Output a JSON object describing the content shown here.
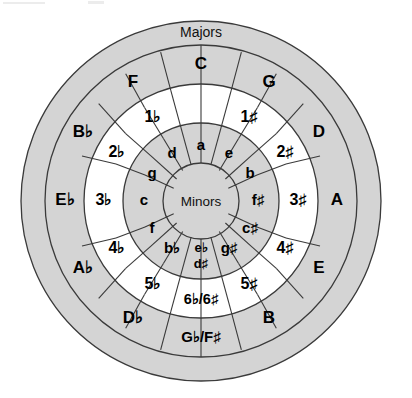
{
  "figure": {
    "outer_band_label": "Majors",
    "center_label": "Minors",
    "geometry": {
      "cx": 201,
      "cy": 201,
      "r_outer": 180,
      "r_band_inner": 156,
      "r_major_inner": 117,
      "r_numbers_inner": 78,
      "r_minor_inner": 38
    },
    "colors": {
      "gray_ring": "#d4d4d4",
      "white_ring": "#ffffff",
      "stroke": "#3a3a3a",
      "text": "#000000",
      "background": "#ffffff"
    }
  },
  "rings": {
    "majors": {
      "name": "majors-ring",
      "segments": [
        {
          "id": "major-c",
          "label": "C",
          "angle": 0
        },
        {
          "id": "major-g",
          "label": "G",
          "angle": 30
        },
        {
          "id": "major-d",
          "label": "D",
          "angle": 60
        },
        {
          "id": "major-a",
          "label": "A",
          "angle": 90
        },
        {
          "id": "major-e",
          "label": "E",
          "angle": 120
        },
        {
          "id": "major-b",
          "label": "B",
          "angle": 150
        },
        {
          "id": "major-gb-fs",
          "label": "G♭/F♯",
          "angle": 180
        },
        {
          "id": "major-db",
          "label": "D♭",
          "angle": 210
        },
        {
          "id": "major-ab",
          "label": "A♭",
          "angle": 240
        },
        {
          "id": "major-eb",
          "label": "E♭",
          "angle": 270
        },
        {
          "id": "major-bb",
          "label": "B♭",
          "angle": 300
        },
        {
          "id": "major-f",
          "label": "F",
          "angle": 330
        }
      ]
    },
    "accidental_counts": {
      "name": "key-signature-ring",
      "segments": [
        {
          "id": "count-0",
          "label": "",
          "angle": 0
        },
        {
          "id": "count-1s",
          "label": "1♯",
          "angle": 30
        },
        {
          "id": "count-2s",
          "label": "2♯",
          "angle": 60
        },
        {
          "id": "count-3s",
          "label": "3♯",
          "angle": 90
        },
        {
          "id": "count-4s",
          "label": "4♯",
          "angle": 120
        },
        {
          "id": "count-5s",
          "label": "5♯",
          "angle": 150
        },
        {
          "id": "count-6b-6s",
          "label": "6♭/6♯",
          "angle": 180
        },
        {
          "id": "count-5b",
          "label": "5♭",
          "angle": 210
        },
        {
          "id": "count-4b",
          "label": "4♭",
          "angle": 240
        },
        {
          "id": "count-3b",
          "label": "3♭",
          "angle": 270
        },
        {
          "id": "count-2b",
          "label": "2♭",
          "angle": 300
        },
        {
          "id": "count-1b",
          "label": "1♭",
          "angle": 330
        }
      ]
    },
    "minors": {
      "name": "minors-ring",
      "segments": [
        {
          "id": "minor-a",
          "label": "a",
          "angle": 0
        },
        {
          "id": "minor-e",
          "label": "e",
          "angle": 30
        },
        {
          "id": "minor-b",
          "label": "b",
          "angle": 60
        },
        {
          "id": "minor-fs",
          "label": "f♯",
          "angle": 90
        },
        {
          "id": "minor-cs",
          "label": "c♯",
          "angle": 120
        },
        {
          "id": "minor-gs",
          "label": "g♯",
          "angle": 150
        },
        {
          "id": "minor-eb-ds",
          "label": "e♭",
          "label2": "d♯",
          "angle": 180
        },
        {
          "id": "minor-bb",
          "label": "b♭",
          "angle": 210
        },
        {
          "id": "minor-f",
          "label": "f",
          "angle": 240
        },
        {
          "id": "minor-c",
          "label": "c",
          "angle": 270
        },
        {
          "id": "minor-g",
          "label": "g",
          "angle": 300
        },
        {
          "id": "minor-d",
          "label": "d",
          "angle": 330
        }
      ]
    }
  },
  "labels": {
    "majors_band": "Majors",
    "minors_center": "Minors",
    "major_c": "C",
    "major_g": "G",
    "major_d": "D",
    "major_a": "A",
    "major_e": "E",
    "major_b": "B",
    "major_gb_fs": "G♭/F♯",
    "major_db": "D♭",
    "major_ab": "A♭",
    "major_eb": "E♭",
    "major_bb": "B♭",
    "major_f": "F",
    "count_1s": "1♯",
    "count_2s": "2♯",
    "count_3s": "3♯",
    "count_4s": "4♯",
    "count_5s": "5♯",
    "count_6b_6s": "6♭/6♯",
    "count_5b": "5♭",
    "count_4b": "4♭",
    "count_3b": "3♭",
    "count_2b": "2♭",
    "count_1b": "1♭",
    "minor_a": "a",
    "minor_e": "e",
    "minor_b": "b",
    "minor_fs": "f♯",
    "minor_cs": "c♯",
    "minor_gs": "g♯",
    "minor_eb": "e♭",
    "minor_ds": "d♯",
    "minor_bb": "b♭",
    "minor_f": "f",
    "minor_c": "c",
    "minor_g": "g",
    "minor_d": "d"
  }
}
